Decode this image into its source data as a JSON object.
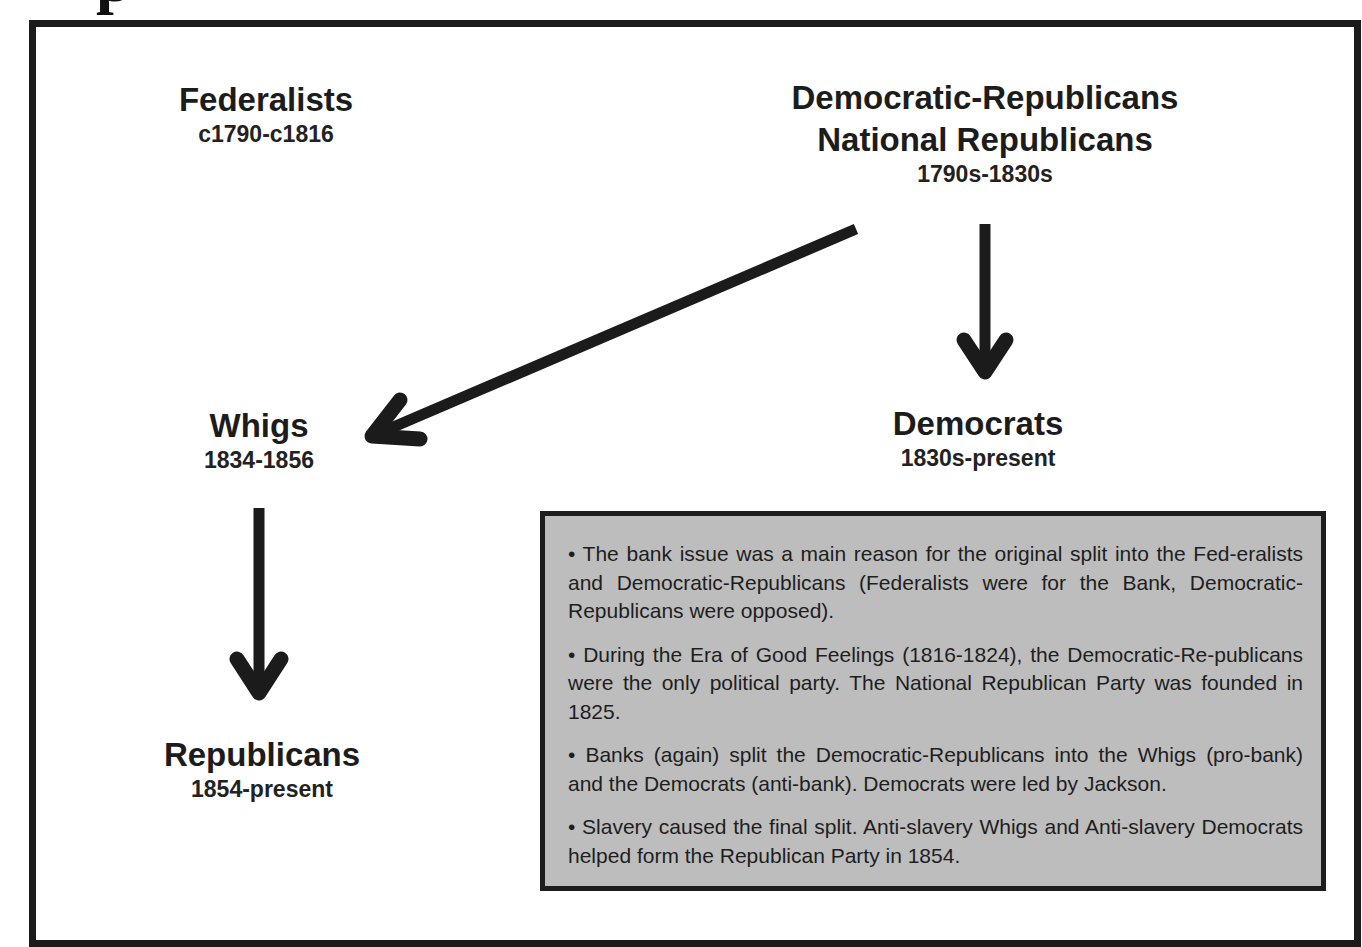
{
  "title_fragment": "p",
  "nodes": {
    "federalists": {
      "name": "Federalists",
      "dates": "c1790-c1816"
    },
    "democratic_republicans": {
      "name_line1": "Democratic-Republicans",
      "name_line2": "National Republicans",
      "dates": "1790s-1830s"
    },
    "whigs": {
      "name": "Whigs",
      "dates": "1834-1856"
    },
    "democrats": {
      "name": "Democrats",
      "dates": "1830s-present"
    },
    "republicans": {
      "name": "Republicans",
      "dates": "1854-present"
    }
  },
  "edges": [
    {
      "from": "democratic_republicans",
      "to": "whigs"
    },
    {
      "from": "democratic_republicans",
      "to": "democrats"
    },
    {
      "from": "whigs",
      "to": "republicans"
    }
  ],
  "notes": [
    "• The bank issue was a main reason for the original split into the Fed-eralists and Democratic-Republicans (Federalists were for the Bank, Democratic-Republicans were opposed).",
    "• During the Era of Good Feelings (1816-1824), the Democratic-Re-publicans were the only political party. The National Republican Party was founded in 1825.",
    "• Banks (again) split the Democratic-Republicans into the Whigs (pro-bank) and the Democrats (anti-bank). Democrats were led by Jackson.",
    "• Slavery caused the final split. Anti-slavery Whigs and Anti-slavery Democrats helped form the Republican Party in 1854."
  ],
  "colors": {
    "ink": "#1b1b1b",
    "notes_fill": "#bdbdbd",
    "background": "#ffffff"
  }
}
